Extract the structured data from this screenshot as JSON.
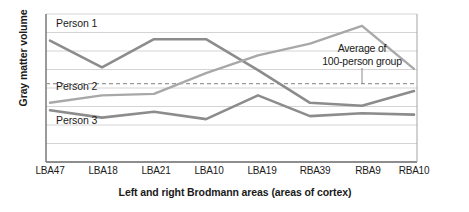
{
  "chart_data": {
    "type": "line",
    "title": "",
    "xlabel": "Left and right Brodmann areas (areas of cortex)",
    "ylabel": "Gray matter volume",
    "categories": [
      "LBA47",
      "LBA18",
      "LBA21",
      "LBA10",
      "LBA19",
      "RBA39",
      "RBA9",
      "RBA10"
    ],
    "ylim": [
      0,
      100
    ],
    "yticks": [],
    "grid": true,
    "gridlines_y": [
      100,
      87.5,
      75,
      62.5,
      50,
      37.5,
      25,
      12.5,
      0
    ],
    "legend_position": "in-plot-labels",
    "series": [
      {
        "name": "Person 1",
        "color": "#8c8c8c",
        "style": "solid",
        "values": [
          82,
          64,
          83,
          83,
          62,
          40,
          38,
          48
        ]
      },
      {
        "name": "Person 2",
        "color": "#a3a3a3",
        "style": "solid",
        "values": [
          40,
          45,
          46,
          60,
          72,
          80,
          92,
          63
        ]
      },
      {
        "name": "Person 3",
        "color": "#8c8c8c",
        "style": "solid",
        "values": [
          35,
          30,
          34,
          29,
          45,
          31,
          33,
          32
        ]
      },
      {
        "name": "Average of 100-person group",
        "color": "#9a9a9a",
        "style": "dashed",
        "values": [
          53,
          53,
          53,
          53,
          53,
          53,
          53,
          53
        ]
      }
    ],
    "annotations": [
      {
        "text_line1": "Average of",
        "text_line2": "100-person group",
        "points_to": "Average of 100-person group"
      }
    ]
  },
  "series_labels": {
    "person1": "Person 1",
    "person2": "Person 2",
    "person3": "Person 3"
  },
  "annotation": {
    "line1": "Average of",
    "line2": "100-person group"
  },
  "axes": {
    "x_title": "Left and right Brodmann areas (areas of cortex)",
    "y_title": "Gray matter volume",
    "x_ticks": [
      "LBA47",
      "LBA18",
      "LBA21",
      "LBA10",
      "LBA19",
      "RBA39",
      "RBA9",
      "RBA10"
    ]
  },
  "credit": {
    "text": "© 2016 Cengage Learning®"
  },
  "colors": {
    "person1_line": "#8c8c8c",
    "person2_line": "#a3a3a3",
    "person3_line": "#8c8c8c",
    "average_line": "#9a9a9a",
    "gridline": "#c9c9c9",
    "axis": "#7a7a7a",
    "text": "#1a1a1a"
  }
}
